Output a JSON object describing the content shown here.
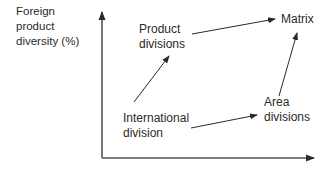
{
  "diagram": {
    "y_axis_label": {
      "line1": "Foreign",
      "line2": "product",
      "line3": "diversity (%)"
    },
    "x_axis_label": "",
    "nodes": {
      "product_divisions": {
        "line1": "Product",
        "line2": "divisions"
      },
      "matrix": {
        "line1": "Matrix"
      },
      "international_division": {
        "line1": "International",
        "line2": "division"
      },
      "area_divisions": {
        "line1": "Area",
        "line2": "divisions"
      }
    },
    "edges": [
      {
        "from": "International division",
        "to": "Product divisions"
      },
      {
        "from": "Product divisions",
        "to": "Matrix"
      },
      {
        "from": "International division",
        "to": "Area divisions"
      },
      {
        "from": "Area divisions",
        "to": "Matrix"
      }
    ],
    "colors": {
      "line": "#2a2a2a",
      "text": "#2a2a2a",
      "background": "#ffffff"
    }
  }
}
